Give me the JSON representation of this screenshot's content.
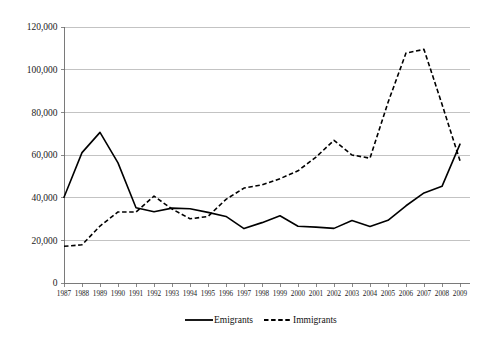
{
  "chart_data": {
    "type": "line",
    "title": "",
    "xlabel": "",
    "ylabel": "",
    "grid": true,
    "legend_position": "bottom",
    "ylim": [
      0,
      120000
    ],
    "xlim": [
      1987,
      2009
    ],
    "ytick_labels": [
      "120,000",
      "100,000",
      "80,000",
      "60,000",
      "40,000",
      "20,000",
      "0"
    ],
    "ytick_values": [
      120000,
      100000,
      80000,
      60000,
      40000,
      20000,
      0
    ],
    "categories": [
      "1987",
      "1988",
      "1989",
      "1990",
      "1991",
      "1992",
      "1993",
      "1994",
      "1995",
      "1996",
      "1997",
      "1998",
      "1999",
      "2000",
      "2001",
      "2002",
      "2003",
      "2004",
      "2005",
      "2006",
      "2007",
      "2008",
      "2009"
    ],
    "series": [
      {
        "name": "Emigrants",
        "style": "solid",
        "color": "#000000",
        "values": [
          40200,
          61100,
          70600,
          56300,
          35300,
          33400,
          35100,
          34800,
          33100,
          31200,
          25500,
          28300,
          31500,
          26600,
          26200,
          25600,
          29300,
          26500,
          29400,
          36200,
          42200,
          45300,
          65100
        ]
      },
      {
        "name": "Immigrants",
        "style": "dashed",
        "color": "#000000",
        "values": [
          17200,
          17900,
          26700,
          33300,
          33300,
          40700,
          34700,
          30100,
          31200,
          39200,
          44500,
          46000,
          48900,
          52600,
          59000,
          66900,
          60000,
          58500,
          84600,
          107800,
          109500,
          83800,
          57300
        ]
      }
    ],
    "legend": [
      {
        "label": "Emigrants",
        "style": "solid"
      },
      {
        "label": "Immigrants",
        "style": "dashed"
      }
    ]
  }
}
